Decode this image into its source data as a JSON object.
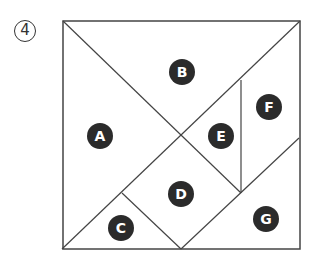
{
  "figure": {
    "number_label": "4",
    "stroke_color": "#444444",
    "label_bg_color": "#2b2b2b",
    "label_text_color": "#ffffff",
    "square": {
      "x1": 63,
      "y1": 21,
      "x2": 300,
      "y2": 249
    },
    "lines": [
      {
        "name": "diagonal-top-left-to-center",
        "x1": 63,
        "y1": 21,
        "x2": 241,
        "y2": 193
      },
      {
        "name": "diagonal-bottom-left-to-top-right",
        "x1": 62,
        "y1": 249,
        "x2": 300,
        "y2": 21
      },
      {
        "name": "vertical-e-f",
        "x1": 241,
        "y1": 80,
        "x2": 241,
        "y2": 193
      },
      {
        "name": "c-d-divider",
        "x1": 122,
        "y1": 193,
        "x2": 181,
        "y2": 249
      },
      {
        "name": "d-g-divider",
        "x1": 181,
        "y1": 249,
        "x2": 299,
        "y2": 138
      }
    ],
    "pieces": [
      {
        "id": "A",
        "label": "A",
        "cx": 100,
        "cy": 136
      },
      {
        "id": "B",
        "label": "B",
        "cx": 182,
        "cy": 72
      },
      {
        "id": "C",
        "label": "C",
        "cx": 121,
        "cy": 228
      },
      {
        "id": "D",
        "label": "D",
        "cx": 181,
        "cy": 194
      },
      {
        "id": "E",
        "label": "E",
        "cx": 221,
        "cy": 136
      },
      {
        "id": "F",
        "label": "F",
        "cx": 269,
        "cy": 107
      },
      {
        "id": "G",
        "label": "G",
        "cx": 266,
        "cy": 219
      }
    ]
  }
}
